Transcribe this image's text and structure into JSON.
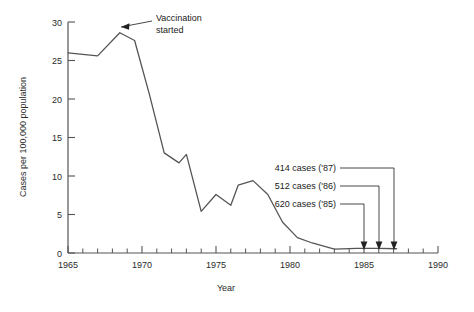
{
  "chart_data": {
    "type": "line",
    "title": "",
    "xlabel": "Year",
    "ylabel": "Cases per 100,000 population",
    "xlim": [
      1965,
      1990
    ],
    "ylim": [
      0,
      30
    ],
    "grid": false,
    "legend": null,
    "x_ticks_major": [
      1965,
      1970,
      1975,
      1980,
      1985,
      1990
    ],
    "x_tick_labels": [
      "1965",
      "1970",
      "1975",
      "1980",
      "1985",
      "1990"
    ],
    "x_minor_tick_step": 1,
    "y_ticks": [
      0,
      5,
      10,
      15,
      20,
      25,
      30
    ],
    "y_tick_labels": [
      "0",
      "5",
      "10",
      "15",
      "20",
      "25",
      "30"
    ],
    "series": [
      {
        "name": "Cases per 100,000 population",
        "color": "#555555",
        "x": [
          1965,
          1966,
          1967,
          1968.5,
          1969.5,
          1970.5,
          1971.5,
          1972.5,
          1973,
          1974,
          1975,
          1976,
          1976.5,
          1977.5,
          1978.5,
          1979.5,
          1980.5,
          1981.5,
          1983,
          1984.5,
          1986,
          1987.2
        ],
        "y": [
          26.0,
          25.8,
          25.6,
          28.6,
          27.6,
          20.6,
          13.0,
          11.7,
          12.8,
          5.4,
          7.6,
          6.2,
          8.8,
          9.4,
          7.6,
          4.0,
          2.0,
          1.3,
          0.5,
          0.6,
          0.6,
          0.55
        ]
      }
    ],
    "annotations": [
      {
        "id": "vaccination-started",
        "text_line1": "Vaccination",
        "text_line2": "started",
        "points_to_year": 1968.5,
        "points_to_value": 28.6
      },
      {
        "id": "cases-1987",
        "text": "414 cases ('87)",
        "year": 1987,
        "cases": 414
      },
      {
        "id": "cases-1986",
        "text": "512 cases ('86)",
        "year": 1986,
        "cases": 512
      },
      {
        "id": "cases-1985",
        "text": "620 cases ('85)",
        "year": 1985,
        "cases": 620
      }
    ]
  }
}
